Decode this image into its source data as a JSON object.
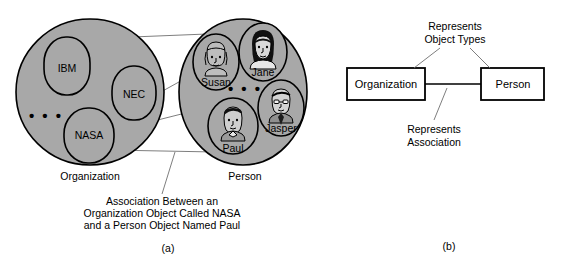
{
  "figure": {
    "panels": [
      {
        "id": "a",
        "label": "(a)"
      },
      {
        "id": "b",
        "label": "(b)"
      }
    ]
  },
  "panel_a": {
    "sets": [
      {
        "name": "Organization",
        "fill": "#a8a8a8",
        "members": [
          {
            "label": "IBM",
            "portrait": false
          },
          {
            "label": "NEC",
            "portrait": false
          },
          {
            "label": "NASA",
            "portrait": false
          }
        ],
        "ellipsis": "•  •  •"
      },
      {
        "name": "Person",
        "fill": "#a8a8a8",
        "members": [
          {
            "label": "Susan",
            "portrait": true,
            "hair": "light-bob"
          },
          {
            "label": "Jane",
            "portrait": true,
            "hair": "dark-long"
          },
          {
            "label": "Jasper",
            "portrait": true,
            "hair": "glasses-tie"
          },
          {
            "label": "Paul",
            "portrait": true,
            "hair": "dark-short"
          }
        ],
        "ellipsis": "•  •  •"
      }
    ],
    "caption": {
      "line1": "Association Between an",
      "line2": "Organization Object Called NASA",
      "line3": "and a Person Object Named Paul"
    },
    "link_count": 3
  },
  "panel_b": {
    "boxes": [
      {
        "label": "Organization"
      },
      {
        "label": "Person"
      }
    ],
    "annotations": [
      {
        "line1": "Represents",
        "line2": "Object Types"
      },
      {
        "line1": "Represents",
        "line2": "Association"
      }
    ]
  },
  "colors": {
    "set_fill": "#a8a8a8",
    "stroke": "#000000",
    "leader": "#6f6f6f",
    "box_fill": "#ffffff"
  }
}
